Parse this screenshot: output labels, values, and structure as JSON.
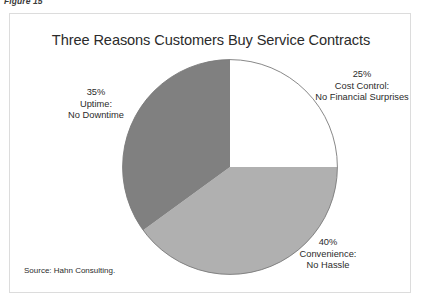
{
  "figure": {
    "caption": "Figure 15"
  },
  "chart_data": {
    "type": "pie",
    "title": "Three Reasons Customers Buy Service Contracts",
    "xlabel": "",
    "ylabel": "",
    "legend": "none",
    "grid": false,
    "start_angle_deg": 0,
    "direction": "clockwise",
    "categories": [
      "Cost Control: No Financial Surprises",
      "Convenience: No Hassle",
      "Uptime: No Downtime"
    ],
    "values": [
      25,
      40,
      35
    ],
    "value_suffix": "%",
    "slices": [
      {
        "name": "cost-control",
        "percent_label": "25%",
        "line1": "Cost Control:",
        "line2": "No Financial Surprises",
        "value": 25,
        "color": "#ffffff",
        "start_deg": 0,
        "end_deg": 90
      },
      {
        "name": "convenience",
        "percent_label": "40%",
        "line1": "Convenience:",
        "line2": "No Hassle",
        "value": 40,
        "color": "#b0b0b0",
        "start_deg": 90,
        "end_deg": 234
      },
      {
        "name": "uptime",
        "percent_label": "35%",
        "line1": "Uptime:",
        "line2": "No Downtime",
        "value": 35,
        "color": "#808080",
        "start_deg": 234,
        "end_deg": 360
      }
    ],
    "outline_color": "#7a7a7a",
    "frame_color": "#dcdcdc"
  },
  "source": {
    "note": "Source: Hahn Consulting."
  }
}
